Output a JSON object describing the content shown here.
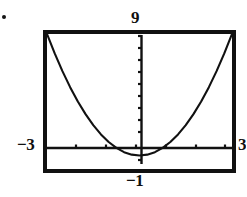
{
  "figure": {
    "name": "graphing-calculator-parabola-window",
    "bullet": "•"
  },
  "window_labels": {
    "ymax": "9",
    "xmin": "−3",
    "ymin": "−1",
    "xmax": "3"
  },
  "chart_data": {
    "type": "line",
    "title": "",
    "xlabel": "",
    "ylabel": "",
    "grid": false,
    "legend": false,
    "axes": {
      "x_axis_visible": true,
      "y_axis_visible": true,
      "x_axis_tick_count": 7,
      "y_axis_tick_count": 10
    },
    "xlim": [
      -3,
      3
    ],
    "ylim": [
      -1,
      9
    ],
    "window": {
      "Xmin": -3,
      "Xmax": 3,
      "Ymin": -1,
      "Ymax": 9
    },
    "series": [
      {
        "name": "parabola",
        "equation": "y = x^2",
        "x": [
          -3.0,
          -2.75,
          -2.5,
          -2.25,
          -2.0,
          -1.75,
          -1.5,
          -1.25,
          -1.0,
          -0.75,
          -0.5,
          -0.25,
          0.0,
          0.25,
          0.5,
          0.75,
          1.0,
          1.25,
          1.5,
          1.75,
          2.0,
          2.25,
          2.5,
          2.75,
          3.0
        ],
        "y": [
          9.0,
          7.5625,
          6.25,
          5.0625,
          4.0,
          3.0625,
          2.25,
          1.5625,
          1.0,
          0.5625,
          0.25,
          0.0625,
          0.0,
          0.0625,
          0.25,
          0.5625,
          1.0,
          1.5625,
          2.25,
          3.0625,
          4.0,
          5.0625,
          6.25,
          7.5625,
          9.0
        ]
      }
    ]
  },
  "colors": {
    "curve": "#111111",
    "frame": "#111111",
    "axis": "#111111",
    "background": "#ffffff",
    "text": "#101010"
  }
}
